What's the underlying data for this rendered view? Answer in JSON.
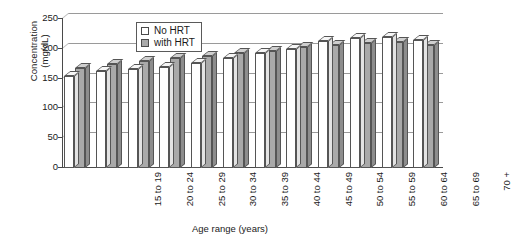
{
  "chart_data": {
    "type": "bar",
    "title": "",
    "xlabel": "Age range (years)",
    "ylabel": "Concentration (mg/dL)",
    "ylabel_line1": "Concentration",
    "ylabel_line2": "(mg/dL)",
    "ylim": [
      0,
      250
    ],
    "yticks": [
      250,
      200,
      150,
      100,
      50,
      0
    ],
    "ytick_labels": [
      "250",
      "200",
      "150",
      "100",
      "50",
      "0"
    ],
    "grid": true,
    "legend_position": "top-left-inside",
    "categories": [
      "15 to 19",
      "20 to 24",
      "25 to 29",
      "30 to 34",
      "35 to 39",
      "40 to 44",
      "45 to 49",
      "50 to 54",
      "55 to 59",
      "60 to 64",
      "65 to 69",
      "70 +"
    ],
    "series": [
      {
        "name": "No HRT",
        "color": "#ffffff",
        "values": [
          155,
          163,
          166,
          170,
          176,
          185,
          193,
          200,
          213,
          218,
          220,
          214
        ]
      },
      {
        "name": "with HRT",
        "color": "#a9a9a9",
        "values": [
          167,
          175,
          180,
          184,
          188,
          193,
          197,
          203,
          207,
          210,
          212,
          206
        ]
      }
    ]
  },
  "legend": {
    "items": [
      {
        "label": "No HRT",
        "swatch": "white"
      },
      {
        "label": "with HRT",
        "swatch": "grey"
      }
    ]
  }
}
